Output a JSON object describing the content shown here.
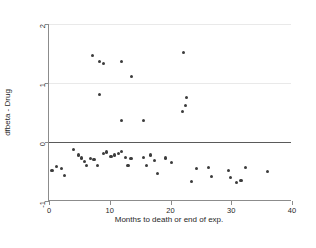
{
  "chart_data": {
    "type": "scatter",
    "title": "",
    "xlabel": "Months to death or end of exp.",
    "ylabel": "dfbeta - Drug",
    "xlim": [
      0,
      40
    ],
    "ylim": [
      -1,
      2
    ],
    "xticks": [
      0,
      10,
      20,
      30,
      40
    ],
    "xticklabels": [
      "0",
      "10",
      "20",
      "30",
      "40"
    ],
    "yticks": [
      -1,
      0,
      1,
      2
    ],
    "yticklabels": [
      "-1",
      "0",
      "1",
      "2"
    ],
    "grid": "horizontal light gridlines at y=1 and y=2; solid reference line at y=0",
    "legend": "none",
    "marker": {
      "shape": "circle",
      "color": "#3c3c3c",
      "size_px": 3.2
    },
    "series": [
      {
        "name": "dfbeta - Drug",
        "points": [
          [
            7.1,
            1.47
          ],
          [
            8.3,
            1.37
          ],
          [
            9.0,
            1.33
          ],
          [
            12.0,
            1.37
          ],
          [
            13.6,
            1.11
          ],
          [
            22.2,
            1.52
          ],
          [
            8.3,
            0.8
          ],
          [
            12.0,
            0.37
          ],
          [
            15.5,
            0.37
          ],
          [
            22.7,
            0.75
          ],
          [
            22.5,
            0.62
          ],
          [
            22.0,
            0.52
          ],
          [
            0.5,
            -0.48
          ],
          [
            1.3,
            -0.42
          ],
          [
            2.0,
            -0.45
          ],
          [
            2.5,
            -0.57
          ],
          [
            4.0,
            -0.13
          ],
          [
            4.8,
            -0.22
          ],
          [
            5.3,
            -0.27
          ],
          [
            5.8,
            -0.33
          ],
          [
            6.2,
            -0.4
          ],
          [
            6.8,
            -0.28
          ],
          [
            7.4,
            -0.3
          ],
          [
            8.0,
            -0.4
          ],
          [
            9.0,
            -0.2
          ],
          [
            9.5,
            -0.17
          ],
          [
            10.2,
            -0.24
          ],
          [
            10.8,
            -0.22
          ],
          [
            11.4,
            -0.19
          ],
          [
            12.0,
            -0.16
          ],
          [
            12.6,
            -0.26
          ],
          [
            13.0,
            -0.4
          ],
          [
            13.5,
            -0.28
          ],
          [
            15.5,
            -0.26
          ],
          [
            16.0,
            -0.4
          ],
          [
            16.7,
            -0.22
          ],
          [
            17.3,
            -0.32
          ],
          [
            17.8,
            -0.53
          ],
          [
            19.2,
            -0.27
          ],
          [
            20.2,
            -0.35
          ],
          [
            23.5,
            -0.67
          ],
          [
            24.3,
            -0.45
          ],
          [
            26.2,
            -0.43
          ],
          [
            26.8,
            -0.58
          ],
          [
            29.5,
            -0.48
          ],
          [
            29.9,
            -0.6
          ],
          [
            30.8,
            -0.68
          ],
          [
            31.6,
            -0.65
          ],
          [
            32.4,
            -0.43
          ],
          [
            36.0,
            -0.5
          ]
        ]
      }
    ]
  }
}
